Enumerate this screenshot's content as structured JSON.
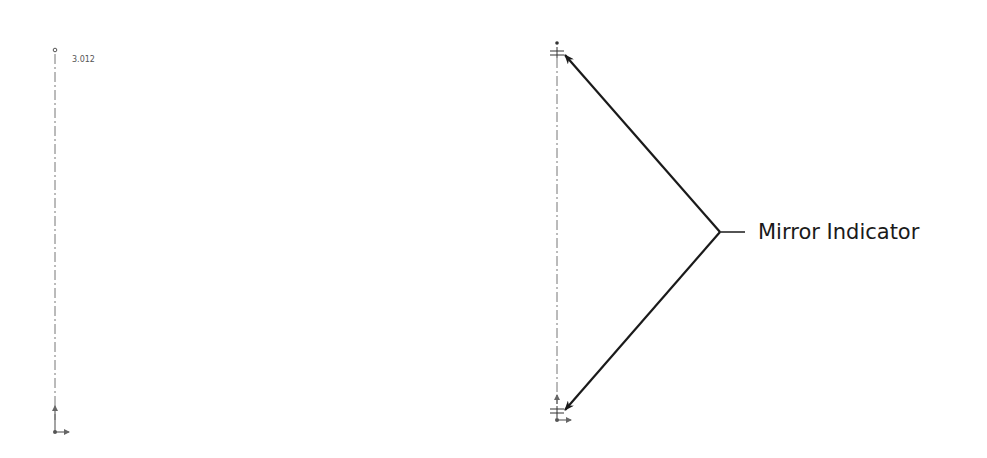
{
  "left_sketch": {
    "dimension_label": "3.012",
    "centerline": {
      "x": 55,
      "y1": 50,
      "y2": 432
    }
  },
  "right_sketch": {
    "centerline": {
      "x": 557,
      "y1": 44,
      "y2": 418
    },
    "callout_label": "Mirror Indicator",
    "callout_vertex": {
      "x": 720,
      "y": 232
    }
  },
  "colors": {
    "line": "#1a1a1a",
    "centerline": "#777777"
  }
}
